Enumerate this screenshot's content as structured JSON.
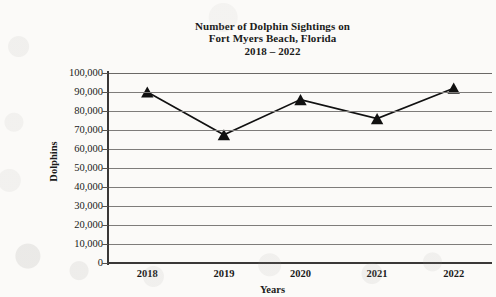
{
  "chart_data": {
    "type": "line",
    "title": "Number of Dolphin Sightings on Fort Myers Beach, Florida 2018 – 2022",
    "title_lines": [
      "Number of Dolphin Sightings on",
      "Fort Myers Beach, Florida",
      "2018 – 2022"
    ],
    "xlabel": "Years",
    "ylabel": "Dolphins",
    "categories": [
      "2018",
      "2019",
      "2020",
      "2021",
      "2022"
    ],
    "values": [
      90000,
      67500,
      86000,
      76000,
      92000
    ],
    "series": [
      {
        "name": "Dolphin Sightings",
        "values": [
          90000,
          67500,
          86000,
          76000,
          92000
        ]
      }
    ],
    "ylim": [
      0,
      100000
    ],
    "ytick_values": [
      100000,
      90000,
      80000,
      70000,
      60000,
      50000,
      40000,
      30000,
      20000,
      10000,
      0
    ],
    "ytick_labels": [
      "100,000",
      "90,000",
      "80,000",
      "70,000",
      "60,000",
      "50,000",
      "40,000",
      "30,000",
      "20,000",
      "10,000",
      "0"
    ],
    "grid": true,
    "grid_axis": "y",
    "legend": false,
    "marker": "triangle",
    "marker_color": "#111111",
    "line_color": "#111111"
  }
}
